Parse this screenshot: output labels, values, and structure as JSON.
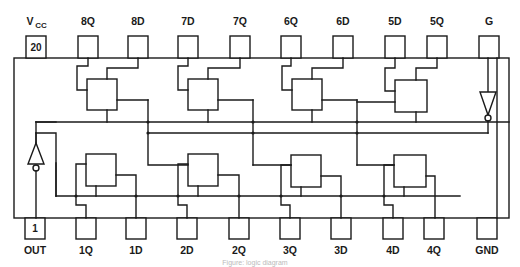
{
  "diagram": {
    "type": "ic-pinout-logic-diagram",
    "top_pins": [
      {
        "pin": "20",
        "label": "V",
        "sub": "CC",
        "x": 36
      },
      {
        "pin": "",
        "label": "8Q",
        "x": 88
      },
      {
        "pin": "",
        "label": "8D",
        "x": 138
      },
      {
        "pin": "",
        "label": "7D",
        "x": 188
      },
      {
        "pin": "",
        "label": "7Q",
        "x": 240
      },
      {
        "pin": "",
        "label": "6Q",
        "x": 291
      },
      {
        "pin": "",
        "label": "6D",
        "x": 343
      },
      {
        "pin": "",
        "label": "5D",
        "x": 395
      },
      {
        "pin": "",
        "label": "5Q",
        "x": 437
      },
      {
        "pin": "",
        "label": "G",
        "x": 489
      }
    ],
    "bottom_pins": [
      {
        "pin": "1",
        "label": "OUT",
        "x": 35
      },
      {
        "pin": "",
        "label": "1Q",
        "x": 86
      },
      {
        "pin": "",
        "label": "1D",
        "x": 136
      },
      {
        "pin": "",
        "label": "2D",
        "x": 187
      },
      {
        "pin": "",
        "label": "2Q",
        "x": 239
      },
      {
        "pin": "",
        "label": "3Q",
        "x": 290
      },
      {
        "pin": "",
        "label": "3D",
        "x": 341
      },
      {
        "pin": "",
        "label": "4D",
        "x": 393
      },
      {
        "pin": "",
        "label": "4Q",
        "x": 434
      },
      {
        "pin": "",
        "label": "GND",
        "x": 487
      }
    ],
    "caption": "Figure: logic diagram"
  }
}
